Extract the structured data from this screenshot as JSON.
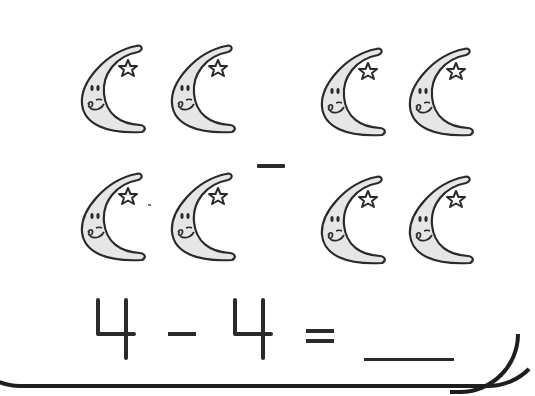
{
  "worksheet": {
    "type": "subtraction-picture-problem",
    "group_a": {
      "count": 4,
      "icon": "smiling-crescent-moon-with-star"
    },
    "group_operator": "−",
    "group_b": {
      "count": 4,
      "icon": "smiling-crescent-moon-with-star"
    },
    "equation": {
      "left_operand": "4",
      "operator": "-",
      "right_operand": "4",
      "equals": "=",
      "answer": ""
    }
  },
  "colors": {
    "outline": "#1e1e1e",
    "moon_fill": "#e6e6e6",
    "background": "#ffffff"
  }
}
